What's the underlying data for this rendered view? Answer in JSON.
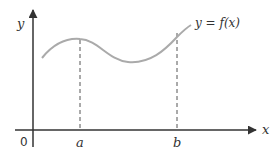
{
  "diagram": {
    "axes": {
      "x_label": "x",
      "y_label": "y",
      "origin_label": "0"
    },
    "curve": {
      "label": "y = f(x)",
      "color": "#aaaaaa"
    },
    "markers": [
      {
        "label": "a"
      },
      {
        "label": "b"
      }
    ],
    "colors": {
      "axis": "#333333",
      "dashed": "#555555",
      "text": "#333333"
    }
  }
}
